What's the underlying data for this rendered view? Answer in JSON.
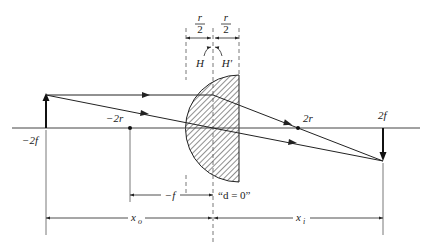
{
  "diagram": {
    "type": "thick-lens-ray-diagram",
    "colors": {
      "line": "#222222",
      "guide": "#555555",
      "background": "#ffffff"
    },
    "axis_labels": {
      "object_pos": "−2f",
      "center_left": "−2r",
      "center_right": "2r",
      "image_pos": "2f"
    },
    "lens_labels": {
      "half_thickness_left_num": "r",
      "half_thickness_left_den": "2",
      "half_thickness_right_num": "r",
      "half_thickness_right_den": "2",
      "principal_plane_1": "H",
      "principal_plane_2": "H′"
    },
    "dimensions": {
      "focal": "−f",
      "d_note": "“d = 0”",
      "object_distance": "x",
      "object_distance_sub": "o",
      "image_distance": "x",
      "image_distance_sub": "i"
    }
  }
}
